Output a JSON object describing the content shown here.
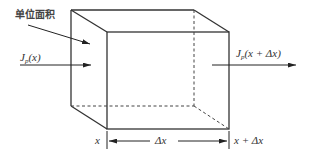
{
  "diagram": {
    "type": "control-volume-flux",
    "colors": {
      "line": "#333333",
      "text": "#333333",
      "background": "#ffffff"
    },
    "labels": {
      "unit_area": "单位面积",
      "flux_in_symbol": "J",
      "flux_in_sub": "p",
      "flux_in_arg": "(x)",
      "flux_out_symbol": "J",
      "flux_out_sub": "p",
      "flux_out_arg": "(x + Δx)",
      "x_left": "x",
      "delta_x": "Δx",
      "x_right": "x + Δx"
    },
    "box": {
      "back_top_left": [
        71,
        10
      ],
      "back_top_right": [
        194,
        10
      ],
      "back_bottom_left": [
        71,
        106
      ],
      "back_bottom_right": [
        194,
        106
      ],
      "front_top_left": [
        107,
        32
      ],
      "front_top_right": [
        229,
        32
      ],
      "front_bottom_left": [
        107,
        129
      ],
      "front_bottom_right": [
        229,
        129
      ]
    }
  }
}
